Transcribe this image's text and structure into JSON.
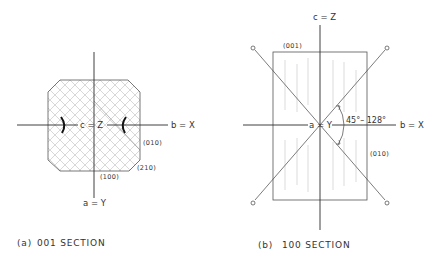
{
  "figure": {
    "panel_a": {
      "caption_letter": "(a)",
      "caption_text": "001  SECTION",
      "axis_horizontal_label": "b = X",
      "axis_center_label": "c = Z",
      "axis_vertical_label": "a = Y",
      "faces": [
        "(010)",
        "(210)",
        "(100)"
      ]
    },
    "panel_b": {
      "caption_letter": "(b)",
      "caption_text": "100  SECTION",
      "axis_top_label": "c = Z",
      "axis_center_label": "a = Y",
      "axis_horizontal_label": "b = X",
      "angle_label": "45°– 128°",
      "faces": [
        "(001)",
        "(010)"
      ]
    },
    "colors": {
      "line": "#2a2a2a",
      "hatch": "#b8b8b8",
      "background": "#ffffff"
    }
  }
}
